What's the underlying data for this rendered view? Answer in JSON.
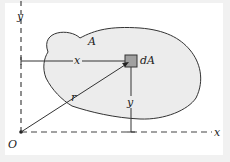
{
  "diagram": {
    "type": "area-element-coordinates",
    "labels": {
      "region": "A",
      "element": "dA",
      "origin": "O",
      "x_axis": "x",
      "y_axis": "y",
      "x_distance": "x",
      "y_distance": "y",
      "radius": "r"
    },
    "colors": {
      "background": "#f1f1f1",
      "panel": "#ffffff",
      "region_fill": "#ededed",
      "element_fill": "#9a9a9a",
      "stroke": "#333333"
    }
  }
}
